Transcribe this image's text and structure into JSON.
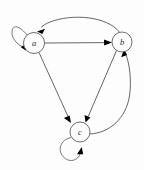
{
  "diagram": {
    "type": "directed-graph",
    "canvas": {
      "width": 144,
      "height": 170,
      "background": "#fdfdfd"
    },
    "style": {
      "edge_color": "#4a4a4a",
      "node_fill": "#fefefe",
      "node_stroke": "#555555",
      "label_color": "#2a2a2a",
      "arrowhead_color": "#000000"
    },
    "nodes": [
      {
        "id": "a",
        "label": "a",
        "cx": 34,
        "cy": 43,
        "r": 10.5
      },
      {
        "id": "b",
        "label": "b",
        "cx": 122,
        "cy": 42,
        "r": 10.0
      },
      {
        "id": "c",
        "label": "c",
        "cx": 80,
        "cy": 132,
        "r": 10.0
      }
    ],
    "edges": [
      {
        "from": "a",
        "to": "a",
        "kind": "self-loop",
        "position": "upper-left"
      },
      {
        "from": "a",
        "to": "b",
        "kind": "straight"
      },
      {
        "from": "b",
        "to": "a",
        "kind": "curved-arc",
        "position": "above"
      },
      {
        "from": "a",
        "to": "c",
        "kind": "straight"
      },
      {
        "from": "b",
        "to": "c",
        "kind": "straight"
      },
      {
        "from": "c",
        "to": "b",
        "kind": "curved-arc",
        "position": "right"
      },
      {
        "from": "c",
        "to": "c",
        "kind": "self-loop",
        "position": "lower-left"
      }
    ]
  }
}
